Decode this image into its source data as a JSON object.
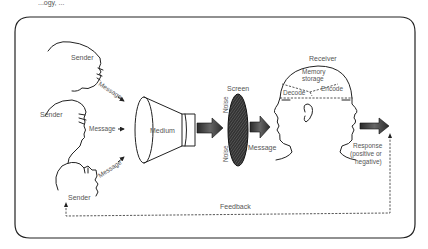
{
  "diagram": {
    "type": "communication-process-model",
    "top_fragment": "...ogy, ...",
    "senders": [
      {
        "label": "Sender",
        "message_label": "Message",
        "position": "top"
      },
      {
        "label": "Sender",
        "message_label": "Message",
        "position": "middle"
      },
      {
        "label": "Sender",
        "message_label": "Message",
        "position": "bottom"
      }
    ],
    "medium": {
      "label": "Medium"
    },
    "noise": {
      "top_label": "Noise",
      "bottom_label": "Noise"
    },
    "screen": {
      "label": "Screen"
    },
    "post_screen_message": {
      "label": "Message"
    },
    "receiver": {
      "label": "Receiver",
      "memory_label_line1": "Memory",
      "memory_label_line2": "storage",
      "decode_label": "Decode",
      "encode_label": "Encode"
    },
    "response": {
      "line1": "Response",
      "line2": "(positive or",
      "line3": "negative)"
    },
    "feedback": {
      "label": "Feedback"
    },
    "edges": [
      {
        "from": "Sender (top)",
        "to": "Medium",
        "label": "Message"
      },
      {
        "from": "Sender (middle)",
        "to": "Medium",
        "label": "Message"
      },
      {
        "from": "Sender (bottom)",
        "to": "Medium",
        "label": "Message"
      },
      {
        "from": "Medium",
        "to": "Screen",
        "label": ""
      },
      {
        "from": "Noise",
        "to": "Screen",
        "label": ""
      },
      {
        "from": "Screen",
        "to": "Receiver",
        "label": "Message"
      },
      {
        "from": "Receiver",
        "to": "Response",
        "label": ""
      },
      {
        "from": "Response",
        "to": "Sender",
        "label": "Feedback",
        "style": "dashed"
      }
    ]
  }
}
